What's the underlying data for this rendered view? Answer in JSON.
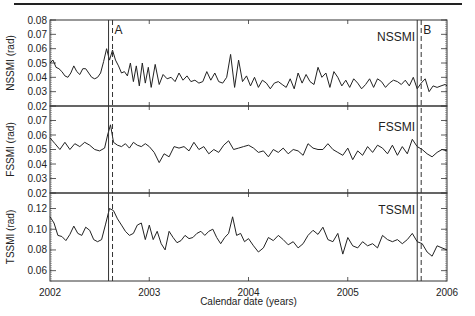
{
  "header_rule": true,
  "chart_data": [
    {
      "type": "line",
      "title": "NSSMI",
      "xlabel": "",
      "ylabel": "NSSMI (rad)",
      "xlim": [
        2002,
        2006
      ],
      "ylim": [
        0.02,
        0.08
      ],
      "yticks": [
        "0.08",
        "0.07",
        "0.06",
        "0.05",
        "0.04",
        "0.03",
        "0.02"
      ],
      "yticks_values": [
        0.08,
        0.07,
        0.06,
        0.05,
        0.04,
        0.03,
        0.02
      ],
      "grid": false,
      "series": [
        {
          "name": "NSSMI",
          "x": [
            2002.0,
            2002.03,
            2002.06,
            2002.09,
            2002.12,
            2002.15,
            2002.18,
            2002.21,
            2002.24,
            2002.27,
            2002.3,
            2002.33,
            2002.36,
            2002.39,
            2002.42,
            2002.45,
            2002.48,
            2002.51,
            2002.54,
            2002.57,
            2002.6,
            2002.63,
            2002.66,
            2002.69,
            2002.72,
            2002.75,
            2002.78,
            2002.81,
            2002.84,
            2002.87,
            2002.9,
            2002.93,
            2002.96,
            2002.99,
            2003.02,
            2003.06,
            2003.1,
            2003.14,
            2003.18,
            2003.22,
            2003.26,
            2003.3,
            2003.34,
            2003.38,
            2003.42,
            2003.46,
            2003.5,
            2003.54,
            2003.58,
            2003.62,
            2003.66,
            2003.7,
            2003.74,
            2003.78,
            2003.82,
            2003.86,
            2003.9,
            2003.94,
            2003.98,
            2004.02,
            2004.06,
            2004.1,
            2004.14,
            2004.18,
            2004.22,
            2004.26,
            2004.3,
            2004.34,
            2004.38,
            2004.42,
            2004.46,
            2004.5,
            2004.54,
            2004.58,
            2004.62,
            2004.66,
            2004.7,
            2004.74,
            2004.78,
            2004.82,
            2004.86,
            2004.9,
            2004.94,
            2004.98,
            2005.02,
            2005.06,
            2005.1,
            2005.14,
            2005.18,
            2005.22,
            2005.26,
            2005.3,
            2005.34,
            2005.38,
            2005.42,
            2005.46,
            2005.5,
            2005.54,
            2005.58,
            2005.62,
            2005.66,
            2005.7,
            2005.74,
            2005.78,
            2005.82,
            2005.86,
            2005.9,
            2005.94,
            2005.98,
            2006.0
          ],
          "values": [
            0.05,
            0.052,
            0.047,
            0.046,
            0.044,
            0.041,
            0.04,
            0.043,
            0.048,
            0.044,
            0.042,
            0.046,
            0.046,
            0.043,
            0.04,
            0.039,
            0.04,
            0.043,
            0.051,
            0.06,
            0.052,
            0.059,
            0.052,
            0.048,
            0.043,
            0.044,
            0.041,
            0.05,
            0.037,
            0.048,
            0.034,
            0.05,
            0.036,
            0.047,
            0.033,
            0.049,
            0.035,
            0.042,
            0.039,
            0.04,
            0.037,
            0.043,
            0.038,
            0.041,
            0.037,
            0.038,
            0.036,
            0.037,
            0.044,
            0.038,
            0.043,
            0.037,
            0.036,
            0.04,
            0.056,
            0.033,
            0.052,
            0.037,
            0.041,
            0.034,
            0.04,
            0.033,
            0.038,
            0.036,
            0.032,
            0.036,
            0.037,
            0.035,
            0.033,
            0.039,
            0.032,
            0.043,
            0.036,
            0.042,
            0.037,
            0.035,
            0.047,
            0.04,
            0.043,
            0.033,
            0.044,
            0.04,
            0.034,
            0.038,
            0.033,
            0.039,
            0.036,
            0.032,
            0.035,
            0.039,
            0.033,
            0.039,
            0.037,
            0.033,
            0.036,
            0.038,
            0.037,
            0.035,
            0.038,
            0.034,
            0.04,
            0.032,
            0.036,
            0.039,
            0.03,
            0.034,
            0.033,
            0.034,
            0.035,
            0.034
          ]
        }
      ],
      "annotations": [
        {
          "text": "A",
          "x": 2002.59
        },
        {
          "text": "B",
          "x": 2005.7
        }
      ]
    },
    {
      "type": "line",
      "title": "FSSMI",
      "xlabel": "",
      "ylabel": "FSSMI (rad)",
      "xlim": [
        2002,
        2006
      ],
      "ylim": [
        0.02,
        0.08
      ],
      "yticks": [
        "0.07",
        "0.06",
        "0.05",
        "0.04",
        "0.03",
        "0.02"
      ],
      "yticks_values": [
        0.07,
        0.06,
        0.05,
        0.04,
        0.03,
        0.02
      ],
      "grid": false,
      "series": [
        {
          "name": "FSSMI",
          "x": [
            2002.0,
            2002.05,
            2002.1,
            2002.15,
            2002.2,
            2002.25,
            2002.3,
            2002.35,
            2002.4,
            2002.45,
            2002.5,
            2002.55,
            2002.58,
            2002.61,
            2002.64,
            2002.68,
            2002.72,
            2002.76,
            2002.8,
            2002.84,
            2002.88,
            2002.92,
            2002.96,
            2003.0,
            2003.05,
            2003.1,
            2003.15,
            2003.2,
            2003.25,
            2003.3,
            2003.35,
            2003.4,
            2003.45,
            2003.5,
            2003.55,
            2003.6,
            2003.65,
            2003.7,
            2003.75,
            2003.8,
            2003.85,
            2003.9,
            2003.95,
            2004.0,
            2004.05,
            2004.1,
            2004.15,
            2004.2,
            2004.25,
            2004.3,
            2004.35,
            2004.4,
            2004.45,
            2004.5,
            2004.55,
            2004.6,
            2004.65,
            2004.7,
            2004.75,
            2004.8,
            2004.85,
            2004.9,
            2004.95,
            2005.0,
            2005.05,
            2005.1,
            2005.15,
            2005.2,
            2005.25,
            2005.3,
            2005.35,
            2005.4,
            2005.45,
            2005.5,
            2005.55,
            2005.6,
            2005.65,
            2005.7,
            2005.75,
            2005.8,
            2005.85,
            2005.9,
            2005.95,
            2006.0
          ],
          "values": [
            0.058,
            0.054,
            0.05,
            0.055,
            0.05,
            0.054,
            0.052,
            0.055,
            0.053,
            0.05,
            0.049,
            0.051,
            0.06,
            0.067,
            0.055,
            0.053,
            0.052,
            0.054,
            0.051,
            0.055,
            0.053,
            0.052,
            0.054,
            0.052,
            0.048,
            0.041,
            0.047,
            0.045,
            0.052,
            0.051,
            0.052,
            0.049,
            0.055,
            0.05,
            0.052,
            0.047,
            0.05,
            0.048,
            0.053,
            0.056,
            0.05,
            0.051,
            0.052,
            0.053,
            0.051,
            0.048,
            0.049,
            0.045,
            0.05,
            0.048,
            0.051,
            0.047,
            0.05,
            0.049,
            0.046,
            0.054,
            0.051,
            0.05,
            0.05,
            0.054,
            0.05,
            0.048,
            0.046,
            0.051,
            0.043,
            0.049,
            0.046,
            0.052,
            0.048,
            0.053,
            0.051,
            0.047,
            0.053,
            0.046,
            0.052,
            0.047,
            0.057,
            0.052,
            0.05,
            0.047,
            0.045,
            0.048,
            0.05,
            0.049
          ]
        }
      ],
      "annotations": []
    },
    {
      "type": "line",
      "title": "TSSMI",
      "xlabel": "Calendar date (years)",
      "ylabel": "TSSMI (rad)",
      "xlim": [
        2002,
        2006
      ],
      "ylim": [
        0.05,
        0.135
      ],
      "yticks": [
        "0.12",
        "0.10",
        "0.08",
        "0.06"
      ],
      "yticks_values": [
        0.12,
        0.1,
        0.08,
        0.06
      ],
      "xticks": [
        "2002",
        "2003",
        "2004",
        "2005",
        "2006"
      ],
      "grid": false,
      "series": [
        {
          "name": "TSSMI",
          "x": [
            2002.0,
            2002.04,
            2002.08,
            2002.12,
            2002.16,
            2002.2,
            2002.24,
            2002.28,
            2002.32,
            2002.36,
            2002.4,
            2002.44,
            2002.48,
            2002.52,
            2002.56,
            2002.6,
            2002.64,
            2002.68,
            2002.72,
            2002.76,
            2002.8,
            2002.84,
            2002.88,
            2002.92,
            2002.96,
            2003.0,
            2003.04,
            2003.08,
            2003.12,
            2003.16,
            2003.2,
            2003.24,
            2003.28,
            2003.32,
            2003.36,
            2003.4,
            2003.44,
            2003.48,
            2003.52,
            2003.56,
            2003.6,
            2003.64,
            2003.68,
            2003.72,
            2003.76,
            2003.8,
            2003.84,
            2003.88,
            2003.92,
            2003.96,
            2004.0,
            2004.05,
            2004.1,
            2004.15,
            2004.2,
            2004.25,
            2004.3,
            2004.35,
            2004.4,
            2004.45,
            2004.5,
            2004.55,
            2004.6,
            2004.65,
            2004.7,
            2004.75,
            2004.8,
            2004.85,
            2004.9,
            2004.95,
            2005.0,
            2005.05,
            2005.1,
            2005.15,
            2005.2,
            2005.25,
            2005.3,
            2005.35,
            2005.4,
            2005.45,
            2005.5,
            2005.55,
            2005.6,
            2005.65,
            2005.7,
            2005.75,
            2005.8,
            2005.85,
            2005.9,
            2005.95,
            2006.0
          ],
          "values": [
            0.112,
            0.106,
            0.094,
            0.093,
            0.089,
            0.095,
            0.103,
            0.096,
            0.094,
            0.102,
            0.099,
            0.09,
            0.088,
            0.09,
            0.105,
            0.12,
            0.118,
            0.11,
            0.104,
            0.098,
            0.094,
            0.096,
            0.104,
            0.106,
            0.09,
            0.104,
            0.09,
            0.098,
            0.086,
            0.08,
            0.098,
            0.092,
            0.087,
            0.089,
            0.094,
            0.091,
            0.092,
            0.096,
            0.098,
            0.094,
            0.098,
            0.1,
            0.092,
            0.086,
            0.092,
            0.096,
            0.112,
            0.094,
            0.096,
            0.088,
            0.091,
            0.084,
            0.078,
            0.082,
            0.092,
            0.089,
            0.094,
            0.09,
            0.085,
            0.088,
            0.082,
            0.086,
            0.094,
            0.099,
            0.095,
            0.102,
            0.09,
            0.088,
            0.096,
            0.076,
            0.092,
            0.084,
            0.082,
            0.088,
            0.084,
            0.086,
            0.082,
            0.094,
            0.09,
            0.088,
            0.09,
            0.086,
            0.09,
            0.096,
            0.088,
            0.086,
            0.078,
            0.074,
            0.084,
            0.082,
            0.08
          ]
        }
      ],
      "annotations": []
    }
  ],
  "markers": {
    "A": {
      "label": "A",
      "solid_x": 2002.59,
      "dashed_x": 2002.63
    },
    "B": {
      "label": "B",
      "solid_x": 2005.7,
      "dashed_x": 2005.74
    }
  }
}
